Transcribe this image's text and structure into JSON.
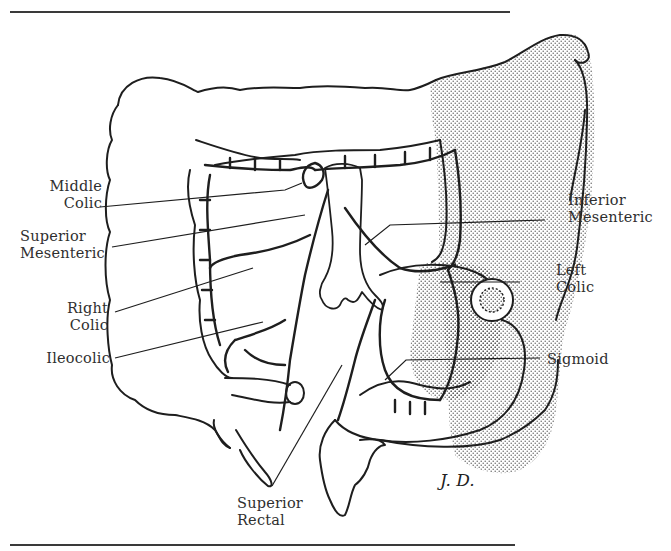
{
  "figure": {
    "type": "anatomical-illustration",
    "signature": "J. D.",
    "labels": {
      "middle_colic": [
        "Middle",
        "Colic"
      ],
      "superior_mesenteric": [
        "Superior",
        "Mesenteric"
      ],
      "right_colic": [
        "Right",
        "Colic"
      ],
      "ileocolic": [
        "Ileocolic"
      ],
      "inferior_mesenteric": [
        "Inferior",
        "Mesenteric"
      ],
      "left_colic": [
        "Left",
        "Colic"
      ],
      "sigmoid": [
        "Sigmoid"
      ],
      "superior_rectal": [
        "Superior",
        "Rectal"
      ]
    }
  },
  "colors": {
    "ink": "#1e1e1e",
    "stipple": "#6a6a6a",
    "paper": "#ffffff",
    "rule": "#3a3a3a"
  }
}
